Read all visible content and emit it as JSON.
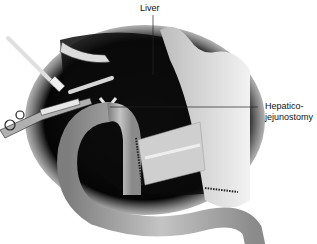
{
  "figure": {
    "labels": {
      "liver": "Liver",
      "anastomosis_line1": "Hepatico-",
      "anastomosis_line2": "jejunostomy"
    },
    "colors": {
      "background": "#ffffff",
      "cavity": "#0d0d0d",
      "bowel": "#9a9a9a",
      "bowel_highlight": "#c8c8c8",
      "tissue": "#d9d9d9",
      "leader_line": "#222222"
    }
  }
}
